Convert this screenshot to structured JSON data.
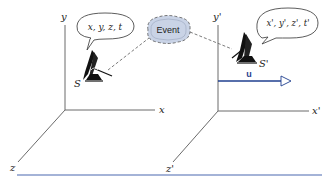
{
  "diagram": {
    "type": "reference-frames",
    "frame_s": {
      "name": "S",
      "axes": {
        "x": "x",
        "y": "y",
        "z": "z"
      },
      "observer_label": "S",
      "bubble_text": "x, y, z, t"
    },
    "frame_s_prime": {
      "name": "S'",
      "axes": {
        "x": "x'",
        "y": "y'",
        "z": "z'"
      },
      "observer_label": "S'",
      "bubble_text": "x', y', z', t'"
    },
    "event": {
      "label": "Event"
    },
    "velocity": {
      "label": "u",
      "direction": "+x'"
    },
    "colors": {
      "axis": "#6b6b6b",
      "velocity_arrow": "#1f3f8f",
      "event_fill": "#c9d3e6",
      "baseline": "#4a68b0"
    }
  }
}
